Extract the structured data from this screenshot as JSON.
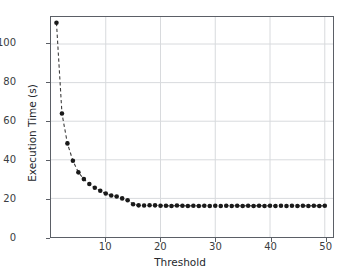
{
  "chart_data": {
    "type": "scatter",
    "title": "",
    "xlabel": "Threshold",
    "ylabel": "Execution Time (s)",
    "xlim": [
      0,
      51.5
    ],
    "ylim": [
      0,
      114
    ],
    "grid": true,
    "legend": null,
    "marker": "circle",
    "marker_color": "#1a1a1a",
    "line_style": "dashed",
    "line_color": "#3c3c3c",
    "xticks": [
      10,
      20,
      30,
      40,
      50
    ],
    "yticks": [
      0,
      20,
      40,
      60,
      80,
      100
    ],
    "x": [
      1,
      2,
      3,
      4,
      5,
      6,
      7,
      8,
      9,
      10,
      11,
      12,
      13,
      14,
      15,
      16,
      17,
      18,
      19,
      20,
      21,
      22,
      23,
      24,
      25,
      26,
      27,
      28,
      29,
      30,
      31,
      32,
      33,
      34,
      35,
      36,
      37,
      38,
      39,
      40,
      41,
      42,
      43,
      44,
      45,
      46,
      47,
      48,
      49,
      50
    ],
    "y": [
      111.0,
      64.0,
      48.5,
      39.5,
      33.5,
      30.0,
      27.5,
      25.5,
      24.0,
      22.5,
      21.5,
      21.0,
      20.0,
      19.0,
      17.0,
      16.4,
      16.3,
      16.5,
      16.4,
      16.2,
      16.2,
      16.1,
      16.3,
      16.2,
      16.1,
      16.2,
      16.1,
      16.2,
      16.1,
      16.2,
      16.1,
      16.2,
      16.1,
      16.2,
      16.1,
      16.2,
      16.1,
      16.2,
      16.1,
      16.2,
      16.1,
      16.2,
      16.1,
      16.2,
      16.1,
      16.2,
      16.1,
      16.2,
      16.1,
      16.2
    ],
    "series": [
      {
        "name": "Execution Time",
        "values": [
          111.0,
          64.0,
          48.5,
          39.5,
          33.5,
          30.0,
          27.5,
          25.5,
          24.0,
          22.5,
          21.5,
          21.0,
          20.0,
          19.0,
          17.0,
          16.4,
          16.3,
          16.5,
          16.4,
          16.2,
          16.2,
          16.1,
          16.3,
          16.2,
          16.1,
          16.2,
          16.1,
          16.2,
          16.1,
          16.2,
          16.1,
          16.2,
          16.1,
          16.2,
          16.1,
          16.2,
          16.1,
          16.2,
          16.1,
          16.2,
          16.1,
          16.2,
          16.1,
          16.2,
          16.1,
          16.2,
          16.1,
          16.2,
          16.1,
          16.2
        ]
      }
    ],
    "colors": {
      "grid": "#d8dadd",
      "axis": "#5b5f66",
      "text": "#25282d",
      "marker": "#1a1a1a",
      "background": "#ffffff"
    }
  }
}
